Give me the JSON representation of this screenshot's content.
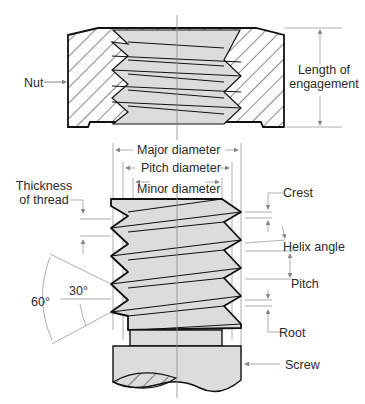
{
  "diagram": {
    "type": "screw-thread-nomenclature",
    "labels": {
      "nut": "Nut",
      "length_of_engagement_1": "Length of",
      "length_of_engagement_2": "engagement",
      "major_diameter": "Major diameter",
      "pitch_diameter": "Pitch diameter",
      "minor_diameter": "Minor diameter",
      "thickness_1": "Thickness",
      "thickness_2": "of thread",
      "crest": "Crest",
      "helix_angle": "Helix angle",
      "pitch": "Pitch",
      "root": "Root",
      "screw": "Screw",
      "angle_60": "60°",
      "angle_30": "30°"
    },
    "colors": {
      "outline": "#111111",
      "thread_fill": "#dcdcdc",
      "dim_line": "#8a8a8a",
      "text": "#2a2a2a"
    }
  }
}
